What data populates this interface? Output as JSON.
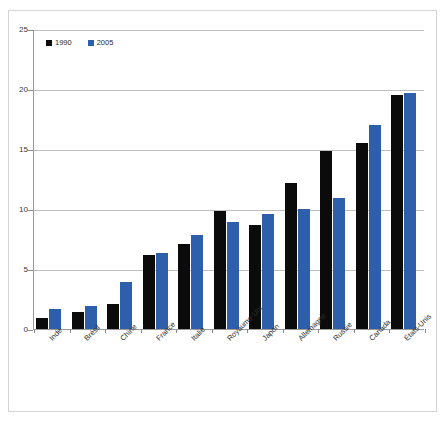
{
  "chart_data": {
    "type": "bar",
    "title": "",
    "subtitle": "",
    "xlabel": "",
    "ylabel": "",
    "ylim": [
      0,
      25
    ],
    "ytick_labels": [
      "0",
      "5",
      "10",
      "15",
      "20",
      "25"
    ],
    "yticks": [
      0,
      5,
      10,
      15,
      20,
      25
    ],
    "grid": true,
    "legend_position": "top-left",
    "categories": [
      "Inde",
      "Brésil",
      "Chine",
      "France",
      "Italie",
      "Royaume-Uni",
      "Japon",
      "Allemagne",
      "Russie",
      "Canada",
      "États-Unis"
    ],
    "series": [
      {
        "name": "1990",
        "color": "#0b0b0b",
        "values": [
          0.9,
          1.4,
          2.1,
          6.2,
          7.1,
          9.8,
          8.7,
          12.2,
          14.8,
          15.5,
          19.5
        ]
      },
      {
        "name": "2005",
        "color": "#2d5faa",
        "values": [
          1.7,
          1.9,
          3.9,
          6.3,
          7.8,
          8.9,
          9.6,
          10.0,
          10.9,
          17.0,
          19.7
        ]
      }
    ]
  },
  "legend": {
    "items": [
      {
        "label": "1990",
        "color": "#0b0b0b"
      },
      {
        "label": "2005",
        "color": "#2d5faa"
      }
    ]
  },
  "axes": {
    "y_labels": [
      "25",
      "20",
      "15",
      "10",
      "5",
      "0"
    ],
    "axis_color": "#9a9a9a",
    "gridline_color": "#bfbfbf"
  }
}
